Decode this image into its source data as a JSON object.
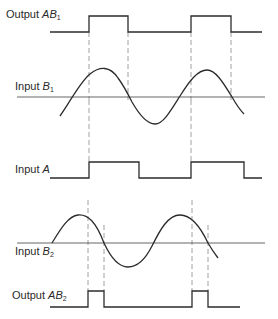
{
  "diagram": {
    "type": "timing-diagram",
    "colors": {
      "trace": "#2b2b2b",
      "axis": "#555555",
      "guide": "#888888",
      "background": "#ffffff"
    },
    "signals": [
      {
        "id": "output_ab1",
        "prefix": "Output ",
        "var": "AB",
        "sub": "1",
        "kind": "pulse"
      },
      {
        "id": "input_b1",
        "prefix": "Input ",
        "var": "B",
        "sub": "1",
        "kind": "sine"
      },
      {
        "id": "input_a",
        "prefix": "Input ",
        "var": "A",
        "sub": "",
        "kind": "square"
      },
      {
        "id": "input_b2",
        "prefix": "Input ",
        "var": "B",
        "sub": "2",
        "kind": "sine"
      },
      {
        "id": "output_ab2",
        "prefix": "Output ",
        "var": "AB",
        "sub": "2",
        "kind": "pulse"
      }
    ]
  }
}
